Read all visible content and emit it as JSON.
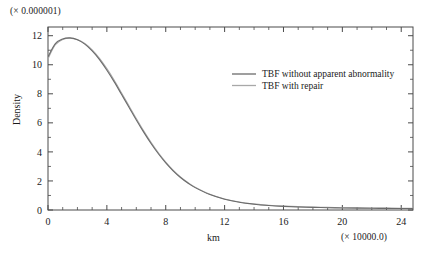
{
  "chart_data": {
    "type": "line",
    "title": "",
    "xlabel": "km",
    "ylabel": "Density",
    "x_multiplier_label": "(× 10000.0)",
    "y_multiplier_label": "(× 0.000001)",
    "xlim": [
      0,
      24.8
    ],
    "ylim": [
      0,
      12.6
    ],
    "xticks": [
      0,
      4,
      8,
      12,
      16,
      20,
      24
    ],
    "xtick_labels": [
      "0",
      "4",
      "8",
      "12",
      "16",
      "20",
      "24"
    ],
    "x_minor_step": 1,
    "yticks": [
      0,
      2,
      4,
      6,
      8,
      10,
      12
    ],
    "ytick_labels": [
      "0",
      "2",
      "4",
      "6",
      "8",
      "10",
      "12"
    ],
    "y_minor_step": 1,
    "grid": false,
    "legend_position": "upper-right-inside",
    "frame": "box",
    "tick_direction": "in",
    "x": [
      0,
      0.5,
      1,
      1.5,
      2,
      2.5,
      3,
      3.5,
      4,
      4.5,
      5,
      5.5,
      6,
      6.5,
      7,
      7.5,
      8,
      8.5,
      9,
      9.5,
      10,
      11,
      12,
      13,
      14,
      15,
      16,
      17,
      18,
      19,
      20,
      21,
      22,
      23,
      24,
      24.8
    ],
    "series": [
      {
        "name": "TBF without apparent abnormality",
        "color": "#6b6b6b",
        "values": [
          10.55,
          11.45,
          11.78,
          11.85,
          11.72,
          11.42,
          10.95,
          10.35,
          9.62,
          8.82,
          7.95,
          7.08,
          6.2,
          5.36,
          4.58,
          3.87,
          3.24,
          2.7,
          2.24,
          1.86,
          1.54,
          1.06,
          0.74,
          0.53,
          0.4,
          0.31,
          0.25,
          0.21,
          0.18,
          0.16,
          0.14,
          0.13,
          0.12,
          0.11,
          0.1,
          0.1
        ]
      },
      {
        "name": "TBF with repair",
        "color": "#a8a8a8",
        "values": [
          10.42,
          11.38,
          11.74,
          11.83,
          11.73,
          11.46,
          11.02,
          10.44,
          9.73,
          8.93,
          8.06,
          7.18,
          6.3,
          5.45,
          4.66,
          3.94,
          3.3,
          2.75,
          2.28,
          1.89,
          1.57,
          1.08,
          0.76,
          0.55,
          0.42,
          0.33,
          0.27,
          0.23,
          0.2,
          0.18,
          0.16,
          0.15,
          0.14,
          0.13,
          0.12,
          0.12
        ]
      }
    ],
    "legend": [
      {
        "label": "TBF without apparent abnormality",
        "color": "#6b6b6b"
      },
      {
        "label": "TBF with repair",
        "color": "#a8a8a8"
      }
    ],
    "colors": {
      "axis": "#4a4a4a",
      "text": "#1a1a1a",
      "background": "#ffffff",
      "series_primary": "#6b6b6b",
      "series_secondary": "#a8a8a8"
    }
  }
}
